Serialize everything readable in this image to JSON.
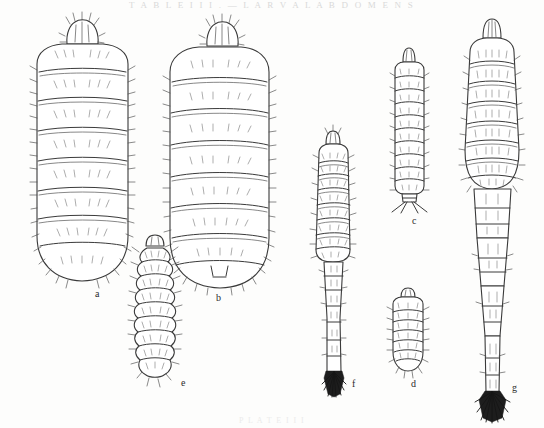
{
  "plate": {
    "width": 544,
    "height": 428,
    "background_color": "#fdfdfc",
    "ink_color": "#333333",
    "header_text": "T A B L E   I I I .   —   L A R V A L   A B D O M E N S",
    "footer_text": "P L A T E   I I I",
    "figure_labels": [
      {
        "id": "a",
        "text": "a",
        "x": 95,
        "y": 289
      },
      {
        "id": "b",
        "text": "b",
        "x": 216,
        "y": 293
      },
      {
        "id": "e",
        "text": "e",
        "x": 181,
        "y": 378
      },
      {
        "id": "c",
        "text": "c",
        "x": 412,
        "y": 216
      },
      {
        "id": "f",
        "text": "f",
        "x": 352,
        "y": 379
      },
      {
        "id": "d",
        "text": "d",
        "x": 411,
        "y": 379
      },
      {
        "id": "g",
        "text": "g",
        "x": 512,
        "y": 383
      }
    ]
  },
  "specimens": [
    {
      "id": "a",
      "label": "a",
      "description": "broad ovoid segmented abdomen with crested terminal process",
      "center_x": 82,
      "top_y": 22,
      "bottom_y": 282,
      "max_width": 106,
      "segment_count": 8,
      "tail_type": "rounded",
      "setae": "dense marginal and dorsal"
    },
    {
      "id": "b",
      "label": "b",
      "description": "large elongate-ovoid segmented abdomen, crested apex",
      "center_x": 218,
      "top_y": 24,
      "bottom_y": 288,
      "max_width": 96,
      "segment_count": 8,
      "tail_type": "rounded-notched",
      "setae": "sparse dorsal, marginal"
    },
    {
      "id": "e",
      "label": "e",
      "description": "small narrow scalloped-margin larva, many short segments",
      "center_x": 155,
      "top_y": 234,
      "bottom_y": 378,
      "max_width": 44,
      "segment_count": 12,
      "tail_type": "tapered-setose",
      "setae": "lobed margin with spines"
    },
    {
      "id": "c",
      "label": "c",
      "description": "narrow elongate abdomen ending in paired divergent caudal filaments",
      "center_x": 409,
      "top_y": 48,
      "bottom_y": 206,
      "max_width": 36,
      "segment_count": 10,
      "tail_type": "paired-filaments",
      "setae": "short scattered"
    },
    {
      "id": "f",
      "label": "f",
      "description": "abdomen tapering to slender caudal stalk with dark terminal brush",
      "center_x": 333,
      "top_y": 131,
      "bottom_y": 393,
      "max_width": 46,
      "segment_count": 9,
      "tail_type": "dark-brush",
      "setae": "scattered dorsal"
    },
    {
      "id": "d",
      "label": "d",
      "description": "small short oval abdomen, rounded apex, marginal setae",
      "center_x": 408,
      "top_y": 288,
      "bottom_y": 372,
      "max_width": 34,
      "segment_count": 8,
      "tail_type": "rounded-setose",
      "setae": "fine marginal"
    },
    {
      "id": "g",
      "label": "g",
      "description": "largest figure: broad segmented abdomen drawn out into long slender tail with dark terminal fan of setae",
      "center_x": 492,
      "top_y": 18,
      "bottom_y": 412,
      "max_width": 54,
      "segment_count": 9,
      "tail_type": "dark-fan",
      "setae": "fine marginal"
    }
  ]
}
